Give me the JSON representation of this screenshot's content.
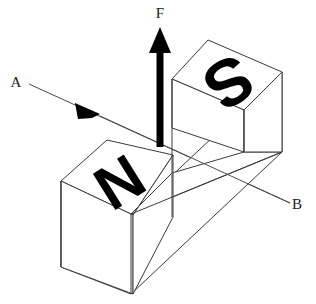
{
  "figure": {
    "background_color": "#ffffff",
    "line_color": "#3a3a3a",
    "ink_color": "#000000"
  },
  "magnet": {
    "shape": "U-shaped bar magnet (isometric)",
    "poles": [
      {
        "id": "south-pole",
        "label": "S",
        "position": "upper-right-block",
        "glyph_rotation_deg": 148
      },
      {
        "id": "north-pole",
        "label": "N",
        "position": "lower-left-block",
        "glyph_rotation_deg": 148
      }
    ]
  },
  "vectors": {
    "force": {
      "label": "F",
      "direction": "up",
      "color": "#000000",
      "label_pos": {
        "x": 160,
        "y": 18
      }
    },
    "ray": {
      "start_label": "A",
      "end_label": "B",
      "direction": "A to B",
      "arrow_at": "midpoint",
      "color": "#4a4a4a",
      "start_label_pos": {
        "x": 16,
        "y": 87
      },
      "end_label_pos": {
        "x": 294,
        "y": 209
      }
    }
  },
  "labels": {
    "force": "F",
    "ray_start": "A",
    "ray_end": "B",
    "pole_south": "S",
    "pole_north": "N"
  }
}
